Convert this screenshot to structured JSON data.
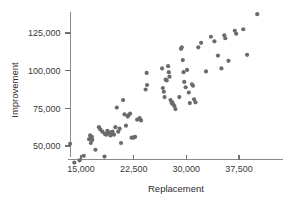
{
  "chart_data": {
    "type": "scatter",
    "title": "",
    "xlabel": "Replacement",
    "ylabel": "Improvement",
    "xlim": [
      12000,
      42500
    ],
    "ylim": [
      36000,
      140000
    ],
    "grid": false,
    "legend": null,
    "xticks": [
      15000,
      22500,
      30000,
      37500
    ],
    "xtick_labels": [
      "15,000",
      "22,500",
      "30,000",
      "37,500"
    ],
    "yticks": [
      50000,
      75000,
      100000,
      125000
    ],
    "ytick_labels": [
      "50,000",
      "75,000",
      "100,000",
      "125,000"
    ],
    "marker": {
      "shape": "circle",
      "color": "#6b6b6b",
      "size": 4.2
    },
    "points": [
      [
        13450,
        51500
      ],
      [
        14050,
        39000
      ],
      [
        14800,
        40500
      ],
      [
        15400,
        43500
      ],
      [
        16150,
        54500
      ],
      [
        16300,
        57000
      ],
      [
        16400,
        52000
      ],
      [
        16550,
        56000
      ],
      [
        16600,
        54000
      ],
      [
        17050,
        47500
      ],
      [
        17550,
        62500
      ],
      [
        17750,
        61000
      ],
      [
        18050,
        59500
      ],
      [
        18350,
        43000
      ],
      [
        18400,
        58000
      ],
      [
        18600,
        57500
      ],
      [
        18750,
        60000
      ],
      [
        18800,
        58500
      ],
      [
        19050,
        59000
      ],
      [
        19200,
        57000
      ],
      [
        19350,
        58000
      ],
      [
        19500,
        59500
      ],
      [
        19700,
        57500
      ],
      [
        19900,
        62500
      ],
      [
        20100,
        75500
      ],
      [
        20300,
        59500
      ],
      [
        20500,
        61500
      ],
      [
        20700,
        52000
      ],
      [
        21000,
        80500
      ],
      [
        21200,
        71000
      ],
      [
        21400,
        63500
      ],
      [
        21650,
        69500
      ],
      [
        21800,
        70500
      ],
      [
        22000,
        71500
      ],
      [
        22200,
        55500
      ],
      [
        22450,
        55500
      ],
      [
        22700,
        56000
      ],
      [
        23000,
        67500
      ],
      [
        23350,
        68500
      ],
      [
        23550,
        67000
      ],
      [
        24200,
        87500
      ],
      [
        24350,
        98500
      ],
      [
        24400,
        90500
      ],
      [
        26550,
        101500
      ],
      [
        26650,
        88500
      ],
      [
        26800,
        86000
      ],
      [
        26900,
        82500
      ],
      [
        27050,
        94000
      ],
      [
        27200,
        93500
      ],
      [
        27400,
        103000
      ],
      [
        27500,
        99000
      ],
      [
        27600,
        96000
      ],
      [
        27750,
        80500
      ],
      [
        27900,
        78500
      ],
      [
        28000,
        79000
      ],
      [
        28150,
        77500
      ],
      [
        28300,
        76500
      ],
      [
        28450,
        74500
      ],
      [
        29000,
        82500
      ],
      [
        29250,
        114500
      ],
      [
        29350,
        115500
      ],
      [
        29500,
        107000
      ],
      [
        29600,
        99000
      ],
      [
        29700,
        92500
      ],
      [
        29900,
        89000
      ],
      [
        30100,
        100500
      ],
      [
        30350,
        85500
      ],
      [
        30500,
        78500
      ],
      [
        30800,
        91000
      ],
      [
        30950,
        90000
      ],
      [
        31100,
        81000
      ],
      [
        31300,
        79000
      ],
      [
        31700,
        115500
      ],
      [
        32100,
        118500
      ],
      [
        32800,
        99500
      ],
      [
        33500,
        122500
      ],
      [
        34000,
        119500
      ],
      [
        34500,
        110000
      ],
      [
        35000,
        101500
      ],
      [
        35400,
        123500
      ],
      [
        35550,
        121500
      ],
      [
        36000,
        106500
      ],
      [
        36900,
        126500
      ],
      [
        37100,
        124500
      ],
      [
        38100,
        127500
      ],
      [
        38650,
        110500
      ],
      [
        40100,
        137500
      ]
    ]
  },
  "axis": {
    "x_title": "Replacement",
    "y_title": "Improvement"
  }
}
